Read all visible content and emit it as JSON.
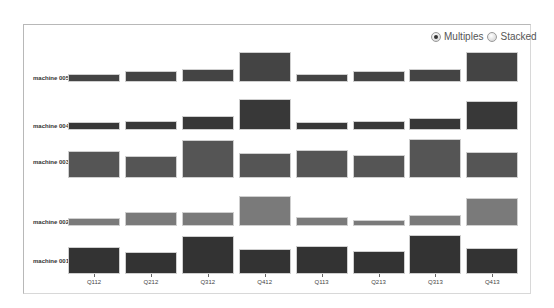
{
  "controls": {
    "options": [
      {
        "label": "Multiples",
        "checked": true
      },
      {
        "label": "Stacked",
        "checked": false
      }
    ]
  },
  "chart_data": {
    "type": "bar",
    "layout": "small-multiples",
    "title": "",
    "xlabel": "",
    "ylabel": "",
    "grid": false,
    "legend": "none",
    "categories": [
      "Q112",
      "Q212",
      "Q312",
      "Q412",
      "Q113",
      "Q213",
      "Q313",
      "Q413"
    ],
    "series": [
      {
        "name": "machine 005",
        "color": "#444444",
        "values": [
          8,
          11,
          13,
          30,
          8,
          11,
          13,
          30
        ]
      },
      {
        "name": "machine 004",
        "color": "#383838",
        "values": [
          8,
          9,
          14,
          31,
          8,
          9,
          12,
          29
        ]
      },
      {
        "name": "machine 003",
        "color": "#555555",
        "values": [
          27,
          22,
          38,
          25,
          28,
          23,
          39,
          26
        ]
      },
      {
        "name": "machine 002",
        "color": "#7a7a7a",
        "values": [
          8,
          14,
          14,
          30,
          9,
          6,
          11,
          28
        ]
      },
      {
        "name": "machine 001",
        "color": "#333333",
        "values": [
          27,
          22,
          38,
          25,
          28,
          23,
          39,
          26
        ]
      }
    ]
  },
  "rows_layout": [
    {
      "baseline": 82,
      "label_y": 75
    },
    {
      "baseline": 130,
      "label_y": 123
    },
    {
      "baseline": 178,
      "label_y": 159
    },
    {
      "baseline": 226,
      "label_y": 219
    },
    {
      "baseline": 274,
      "label_y": 258
    }
  ]
}
